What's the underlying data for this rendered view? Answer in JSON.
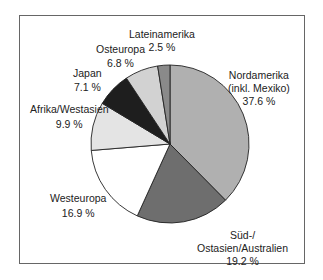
{
  "chart_data": {
    "type": "pie",
    "title": "",
    "start_angle": "12 o'clock, clockwise",
    "slices": [
      {
        "label": "Nordamerika (inkl. Mexiko)",
        "label_lines": [
          "Nordamerika",
          "(inkl. Mexiko)"
        ],
        "value": 37.6,
        "value_text": "37.6 %",
        "color": "#b0b0b0"
      },
      {
        "label": "Süd-/Ostasien/Australien",
        "label_lines": [
          "Süd-/",
          "Ostasien/Australien"
        ],
        "value": 19.2,
        "value_text": "19.2 %",
        "color": "#6e6e6e"
      },
      {
        "label": "Westeuropa",
        "label_lines": [
          "Westeuropa"
        ],
        "value": 16.9,
        "value_text": "16.9 %",
        "color": "#ffffff"
      },
      {
        "label": "Afrika/Westasien",
        "label_lines": [
          "Afrika/Westasien"
        ],
        "value": 9.9,
        "value_text": "9.9 %",
        "color": "#e4e4e4"
      },
      {
        "label": "Japan",
        "label_lines": [
          "Japan"
        ],
        "value": 7.1,
        "value_text": "7.1 %",
        "color": "#1e1e1e"
      },
      {
        "label": "Osteuropa",
        "label_lines": [
          "Osteuropa"
        ],
        "value": 6.8,
        "value_text": "6.8 %",
        "color": "#d2d2d2"
      },
      {
        "label": "Lateinamerika",
        "label_lines": [
          "Lateinamerika"
        ],
        "value": 2.5,
        "value_text": "2.5 %",
        "color": "#8a8a8a"
      }
    ],
    "legend": "none (direct labels)"
  }
}
